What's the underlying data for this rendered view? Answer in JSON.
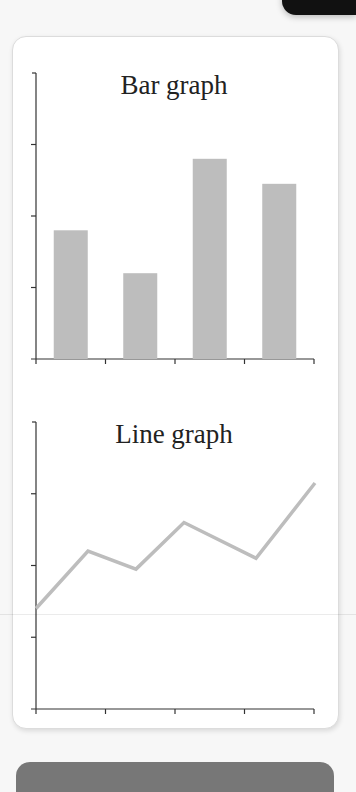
{
  "chart_data": [
    {
      "type": "bar",
      "title": "Bar graph",
      "categories": [
        "",
        "",
        "",
        ""
      ],
      "values": [
        1.8,
        1.2,
        2.8,
        2.45
      ],
      "xlabel": "",
      "ylabel": "",
      "ylim": [
        0,
        4
      ],
      "y_ticks": 4,
      "x_ticks": 4,
      "grid": false,
      "bar_color": "#bdbdbd"
    },
    {
      "type": "line",
      "title": "Line graph",
      "x": [
        0,
        1,
        2,
        3,
        4,
        5
      ],
      "values": [
        1.4,
        2.2,
        1.95,
        2.6,
        2.1,
        3.15
      ],
      "xlabel": "",
      "ylabel": "",
      "ylim": [
        0,
        4
      ],
      "y_ticks": 4,
      "x_ticks": 4,
      "grid": false,
      "line_color": "#bdbdbd"
    }
  ],
  "charts": {
    "bar": {
      "title": "Bar graph"
    },
    "line": {
      "title": "Line graph"
    }
  },
  "colors": {
    "axis": "#333333",
    "series": "#bdbdbd",
    "card_bg": "#ffffff",
    "page_bg": "#f7f7f7"
  }
}
